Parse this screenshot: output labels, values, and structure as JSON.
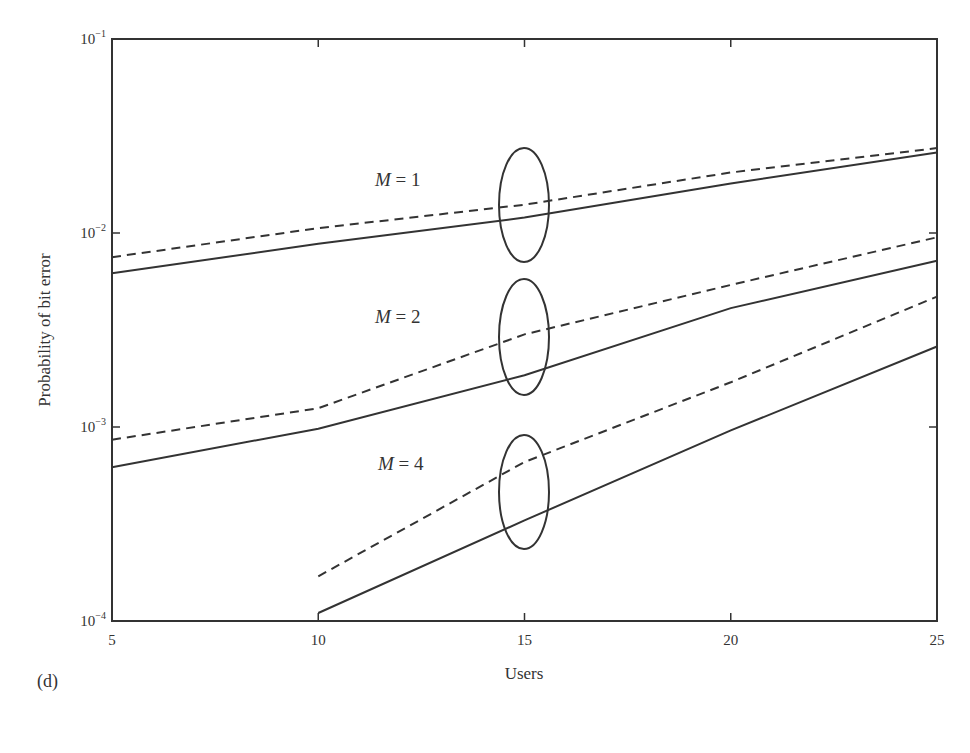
{
  "panel_label": "(d)",
  "chart_data": {
    "type": "line",
    "title": "",
    "xlabel": "Users",
    "ylabel": "Probability of bit error",
    "xscale": "linear",
    "yscale": "log",
    "xlim": [
      5,
      25
    ],
    "ylim": [
      0.0001,
      0.1
    ],
    "x_ticks": [
      5,
      10,
      15,
      20,
      25
    ],
    "y_ticks": [
      {
        "value": 0.1,
        "base": "10",
        "exp": "−1"
      },
      {
        "value": 0.01,
        "base": "10",
        "exp": "−2"
      },
      {
        "value": 0.001,
        "base": "10",
        "exp": "−3"
      },
      {
        "value": 0.0001,
        "base": "10",
        "exp": "−4"
      }
    ],
    "grid": false,
    "legend": "none (groups annotated with ellipses at Users = 15)",
    "annotations": [
      {
        "text_italic": "M",
        "text_rest": " = 1",
        "x": 375,
        "y": 186,
        "ellipse": {
          "cx": 524,
          "cy": 205,
          "rx": 25,
          "ry": 57
        }
      },
      {
        "text_italic": "M",
        "text_rest": " = 2",
        "x": 375,
        "y": 323,
        "ellipse": {
          "cx": 524,
          "cy": 337,
          "rx": 25,
          "ry": 58
        }
      },
      {
        "text_italic": "M",
        "text_rest": " = 4",
        "x": 378,
        "y": 470,
        "ellipse": {
          "cx": 524,
          "cy": 492,
          "rx": 25,
          "ry": 57
        }
      }
    ],
    "series": [
      {
        "name": "M=1 solid",
        "group": "M = 1",
        "style": "solid",
        "x": [
          5,
          10,
          15,
          20,
          25
        ],
        "y": [
          0.0062,
          0.0088,
          0.012,
          0.018,
          0.026
        ]
      },
      {
        "name": "M=1 dashed",
        "group": "M = 1",
        "style": "dashed",
        "x": [
          5,
          10,
          15,
          20,
          25
        ],
        "y": [
          0.0075,
          0.0106,
          0.014,
          0.0205,
          0.0274
        ]
      },
      {
        "name": "M=2 solid",
        "group": "M = 2",
        "style": "solid",
        "x": [
          5,
          10,
          15,
          20,
          25
        ],
        "y": [
          0.00062,
          0.00098,
          0.00185,
          0.0041,
          0.0072
        ]
      },
      {
        "name": "M=2 dashed",
        "group": "M = 2",
        "style": "dashed",
        "x": [
          5,
          10,
          15,
          20,
          25
        ],
        "y": [
          0.00086,
          0.00125,
          0.003,
          0.0054,
          0.0095
        ]
      },
      {
        "name": "M=4 solid",
        "group": "M = 4",
        "style": "solid",
        "x": [
          10,
          15,
          20,
          25
        ],
        "y": [
          0.00011,
          0.00033,
          0.00096,
          0.0026
        ]
      },
      {
        "name": "M=4 dashed",
        "group": "M = 4",
        "style": "dashed",
        "x": [
          10,
          15,
          20,
          25
        ],
        "y": [
          0.00017,
          0.00066,
          0.0017,
          0.0047
        ]
      }
    ]
  }
}
